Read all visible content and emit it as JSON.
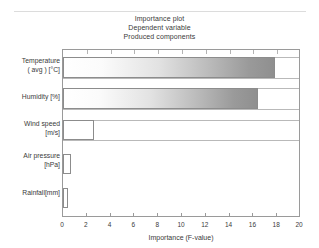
{
  "chart_data": {
    "type": "bar",
    "orientation": "horizontal",
    "title": "Importance plot",
    "subtitle": "Dependent variable",
    "subtitle2": "Produced components",
    "xlabel": "Importance (F-value)",
    "ylabel": "",
    "xlim": [
      0,
      20
    ],
    "xticks": [
      0,
      2,
      4,
      6,
      8,
      10,
      12,
      14,
      16,
      18,
      20
    ],
    "grid": false,
    "legend": null,
    "categories": [
      "Temperature ( avg )  [°C]",
      "Humidity [%]",
      "Wind speed [m/s]",
      "Air pressure [hPa]",
      "Rainfall [mm]"
    ],
    "values": [
      17.8,
      16.4,
      2.6,
      0.7,
      0.4
    ],
    "series": [
      {
        "name": "Importance (F-value)",
        "values": [
          17.8,
          16.4,
          2.6,
          0.7,
          0.4
        ]
      }
    ],
    "bar_styles": [
      "gradient-gray",
      "gradient-gray",
      "hollow",
      "hollow",
      "hollow"
    ]
  },
  "titles": {
    "line1": "Importance plot",
    "line2": "Dependent variable",
    "line3": "Produced components"
  },
  "axis": {
    "xlabel": "Importance (F-value)",
    "xticks": [
      "0",
      "2",
      "4",
      "6",
      "8",
      "10",
      "12",
      "14",
      "16",
      "18",
      "20"
    ]
  },
  "categories": [
    {
      "line1": "Temperature",
      "line2": "( avg )  [°C]"
    },
    {
      "line1": "Humidity [%]",
      "line2": ""
    },
    {
      "line1": "Wind speed",
      "line2": "[m/s]"
    },
    {
      "line1": "Air pressure",
      "line2": "[hPa]"
    },
    {
      "line1": "Rainfall[mm]",
      "line2": ""
    }
  ],
  "colors": {
    "bar_gradient_start": "#ffffff",
    "bar_gradient_end": "#8f8f8f",
    "bar_outline": "#8c8c8c",
    "axis": "#9a9a9a",
    "text": "#3a3a3a",
    "background": "#ffffff"
  }
}
